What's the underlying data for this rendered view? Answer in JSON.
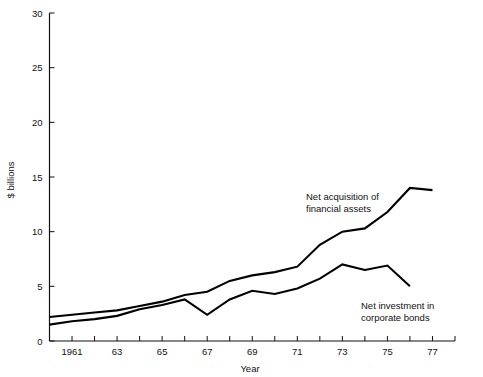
{
  "chart_data": {
    "type": "line",
    "title": "",
    "xlabel": "Year",
    "ylabel": "$ billions",
    "xlim": [
      1960,
      1978
    ],
    "ylim": [
      0,
      30
    ],
    "grid": false,
    "legend_position": "inline-annotation",
    "x": [
      1960,
      1961,
      1962,
      1963,
      1964,
      1965,
      1966,
      1967,
      1968,
      1969,
      1970,
      1971,
      1972,
      1973,
      1974,
      1975,
      1976,
      1977
    ],
    "y_ticks": [
      0,
      5,
      10,
      15,
      20,
      25,
      30
    ],
    "y_tick_labels": [
      "0",
      "5",
      "10",
      "15",
      "20",
      "25",
      "30"
    ],
    "x_ticks": [
      1960,
      1961,
      1962,
      1963,
      1964,
      1965,
      1966,
      1967,
      1968,
      1969,
      1970,
      1971,
      1972,
      1973,
      1974,
      1975,
      1976,
      1977,
      1978
    ],
    "x_tick_labels": [
      "",
      "1961",
      "",
      "63",
      "",
      "65",
      "",
      "67",
      "",
      "69",
      "",
      "71",
      "",
      "73",
      "",
      "75",
      "",
      "77",
      ""
    ],
    "series": [
      {
        "name": "Net acquisition of financial assets",
        "x": [
          1960,
          1961,
          1962,
          1963,
          1964,
          1965,
          1966,
          1967,
          1968,
          1969,
          1970,
          1971,
          1972,
          1973,
          1974,
          1975,
          1976,
          1977
        ],
        "values": [
          2.2,
          2.4,
          2.6,
          2.8,
          3.2,
          3.6,
          4.2,
          4.5,
          5.5,
          6.0,
          6.3,
          6.8,
          8.8,
          10.0,
          10.3,
          11.8,
          14.0,
          13.8
        ],
        "annotation": "Net acquisition of\nfinancial assets"
      },
      {
        "name": "Net investment in corporate bonds",
        "x": [
          1960,
          1961,
          1962,
          1963,
          1964,
          1965,
          1966,
          1967,
          1968,
          1969,
          1970,
          1971,
          1972,
          1973,
          1974,
          1975,
          1976
        ],
        "values": [
          1.5,
          1.8,
          2.0,
          2.3,
          2.9,
          3.3,
          3.8,
          2.4,
          3.8,
          4.6,
          4.3,
          4.8,
          5.7,
          7.0,
          6.5,
          6.9,
          5.0
        ],
        "annotation": "Net investment in\ncorporate bonds"
      }
    ],
    "annotations": [
      {
        "id": "annotation-upper",
        "line1": "Net acquisition of",
        "line2": "financial assets",
        "x": 306,
        "y": 200
      },
      {
        "id": "annotation-lower",
        "line1": "Net investment in",
        "line2": "corporate bonds",
        "x": 361,
        "y": 309
      }
    ],
    "colors": {
      "line": "#000000",
      "axis": "#111111",
      "background": "#ffffff",
      "text": "#111111"
    }
  },
  "axes": {
    "y_axis_title": "$ billions",
    "x_axis_title": "Year"
  }
}
